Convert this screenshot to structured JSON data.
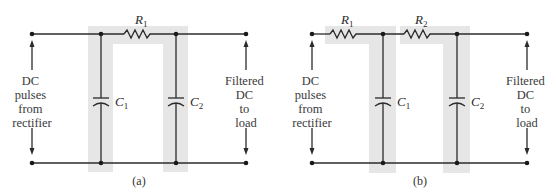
{
  "figure": {
    "panels": [
      {
        "id": "a",
        "caption": "(a)",
        "components": {
          "r1": {
            "name": "R",
            "sub": "1"
          },
          "c1": {
            "name": "C",
            "sub": "1"
          },
          "c2": {
            "name": "C",
            "sub": "2"
          }
        },
        "topology": "pi-filter (C1 - R1 - C2)",
        "input_label": [
          "DC",
          "pulses",
          "from",
          "rectifier"
        ],
        "output_label": [
          "Filtered",
          "DC",
          "to",
          "load"
        ]
      },
      {
        "id": "b",
        "caption": "(b)",
        "components": {
          "r1": {
            "name": "R",
            "sub": "1"
          },
          "r2": {
            "name": "R",
            "sub": "2"
          },
          "c1": {
            "name": "C",
            "sub": "1"
          },
          "c2": {
            "name": "C",
            "sub": "2"
          }
        },
        "topology": "two-section RC filter (R1 - C1 - R2 - C2)",
        "input_label": [
          "DC",
          "pulses",
          "from",
          "rectifier"
        ],
        "output_label": [
          "Filtered",
          "DC",
          "to",
          "load"
        ]
      }
    ],
    "colors": {
      "wire": "#2b2b2b",
      "highlight_band": "#e6e6e6",
      "text": "#3a3a3a"
    }
  }
}
